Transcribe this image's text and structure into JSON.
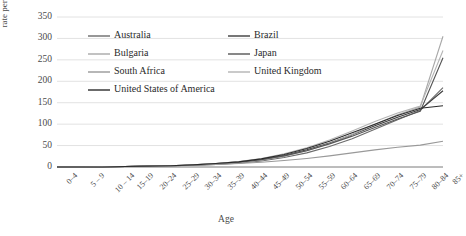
{
  "chart_data": {
    "type": "line",
    "title": "",
    "xlabel": "Age",
    "ylabel": "rate per 100 000",
    "ylim": [
      0,
      350
    ],
    "yticks": [
      0,
      50,
      100,
      150,
      200,
      250,
      300,
      350
    ],
    "grid": true,
    "legend_position": "inside-top-left",
    "categories": [
      "0–4",
      "5 – 9",
      "10 – 14",
      "15–19",
      "20–24",
      "25–29",
      "30–34",
      "35–39",
      "40–44",
      "45–49",
      "50–54",
      "55–59",
      "60–64",
      "65–69",
      "70–74",
      "75–79",
      "80–84",
      "85+"
    ],
    "series": [
      {
        "name": "Australia",
        "color": "#6b6b6b",
        "values": [
          0,
          0,
          0,
          1,
          2,
          3,
          4,
          6,
          9,
          14,
          22,
          33,
          48,
          66,
          88,
          110,
          132,
          185
        ]
      },
      {
        "name": "Brazil",
        "color": "#3d3d3d",
        "values": [
          0,
          0,
          0,
          1,
          2,
          3,
          5,
          8,
          12,
          18,
          27,
          40,
          56,
          75,
          96,
          116,
          134,
          178
        ]
      },
      {
        "name": "Bulgaria",
        "color": "#a8a8a8",
        "values": [
          0,
          0,
          0,
          1,
          1,
          2,
          4,
          6,
          10,
          16,
          25,
          38,
          55,
          76,
          100,
          122,
          140,
          305
        ]
      },
      {
        "name": "Japan",
        "color": "#555555",
        "values": [
          0,
          0,
          0,
          1,
          2,
          3,
          4,
          7,
          11,
          17,
          26,
          38,
          54,
          72,
          92,
          112,
          130,
          255
        ]
      },
      {
        "name": "South Africa",
        "color": "#999999",
        "values": [
          0,
          0,
          1,
          1,
          2,
          3,
          4,
          6,
          8,
          11,
          15,
          20,
          26,
          33,
          40,
          46,
          51,
          60
        ]
      },
      {
        "name": "United Kingdom",
        "color": "#b4b4b4",
        "values": [
          0,
          0,
          0,
          1,
          2,
          3,
          5,
          8,
          13,
          20,
          31,
          45,
          63,
          84,
          106,
          126,
          142,
          272
        ]
      },
      {
        "name": "United States of America",
        "color": "#2b2b2b",
        "values": [
          0,
          0,
          0,
          1,
          2,
          3,
          5,
          8,
          12,
          19,
          29,
          43,
          60,
          80,
          100,
          120,
          137,
          143
        ]
      }
    ]
  },
  "legend": {
    "col1": [
      "Australia",
      "Bulgaria",
      "South Africa",
      "United States of America"
    ],
    "col2": [
      "Brazil",
      "Japan",
      "United Kingdom"
    ]
  }
}
